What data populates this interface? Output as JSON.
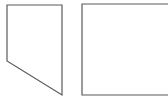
{
  "diagram": {
    "stroke_color": "#5a5a5a",
    "background": "#ffffff",
    "shapes": [
      {
        "name": "left-pentagon",
        "type": "polygon",
        "points": "7,5 62,5 62,95 7,61"
      },
      {
        "name": "right-rectangle",
        "type": "open-rectangle",
        "x": 82,
        "y": 4,
        "width": 86,
        "height": 91
      }
    ]
  }
}
